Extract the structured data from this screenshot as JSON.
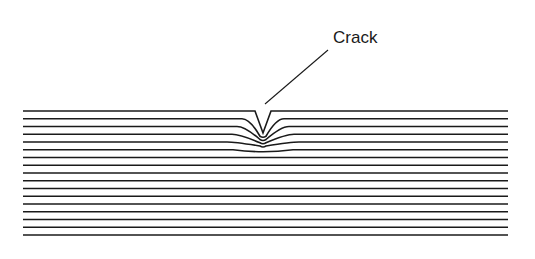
{
  "figure": {
    "annotation": {
      "label": "Crack"
    },
    "layers": {
      "count": 17,
      "x_start": 23,
      "x_end": 508,
      "y_top": 111,
      "spacing": 7.75
    },
    "crack": {
      "center_x": 263
    },
    "colors": {
      "line": "#1a1a1a",
      "background": "#ffffff"
    }
  }
}
